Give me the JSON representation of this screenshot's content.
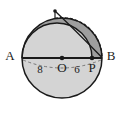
{
  "figure": {
    "background_color": "#ffffff",
    "stroke_color": "#1a1a1a",
    "fill_light": "#d2d2d2",
    "fill_dark": "#9a9a9a",
    "labels": {
      "vertex_a": "A",
      "vertex_b": "B",
      "center_o": "O",
      "point_p": "P",
      "segment_ao": "8",
      "segment_op": "6"
    },
    "points": {
      "a": {
        "x": 22,
        "y": 58
      },
      "b": {
        "x": 102,
        "y": 58
      },
      "o": {
        "x": 62,
        "y": 58
      },
      "p": {
        "x": 92,
        "y": 58
      },
      "apex": {
        "x": 55,
        "y": 11
      }
    },
    "label_positions": {
      "a": {
        "x": 10,
        "y": 57
      },
      "b": {
        "x": 111,
        "y": 57
      },
      "o": {
        "x": 62,
        "y": 69
      },
      "p": {
        "x": 92,
        "y": 69
      },
      "eight": {
        "x": 40,
        "y": 70
      },
      "six": {
        "x": 77,
        "y": 70
      }
    },
    "circle": {
      "cx": 62,
      "cy": 58,
      "r": 40
    },
    "dashes": {
      "pattern": "3,2"
    }
  }
}
